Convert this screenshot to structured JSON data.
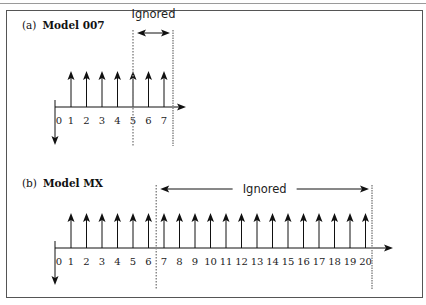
{
  "panels": [
    {
      "label": "(a)",
      "title": "Model 007",
      "ticks": [
        "0",
        "1",
        "2",
        "3",
        "4",
        "5",
        "6",
        "7"
      ],
      "ignored_label": "Ignored",
      "ignored_range": [
        5,
        7
      ]
    },
    {
      "label": "(b)",
      "title": "Model MX",
      "ticks": [
        "0",
        "1",
        "2",
        "3",
        "4",
        "5",
        "6",
        "7",
        "8",
        "9",
        "10",
        "11",
        "12",
        "13",
        "14",
        "15",
        "16",
        "17",
        "18",
        "19",
        "20"
      ],
      "ignored_label": "Ignored",
      "ignored_range": [
        7,
        20
      ]
    }
  ],
  "colors": {
    "line": "#111111",
    "dotted": "#8a8a8a",
    "frame": "#555555"
  }
}
